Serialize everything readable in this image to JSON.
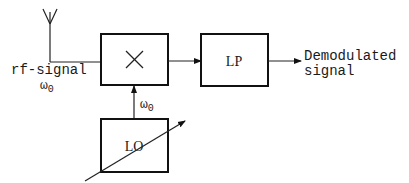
{
  "diagram": {
    "nodes": {
      "antenna": {
        "label": ""
      },
      "input": {
        "label": "rf-signal",
        "frequency": "ω",
        "frequency_sub": "0"
      },
      "mixer": {
        "label": "",
        "symbol": "×"
      },
      "lowpass": {
        "label": "LP"
      },
      "oscillator": {
        "label": "LO",
        "frequency": "ω",
        "frequency_sub": "0",
        "tunable": true
      },
      "output": {
        "line1": "Demodulated",
        "line2": "signal"
      }
    },
    "edges": [
      {
        "from": "antenna",
        "to": "mixer"
      },
      {
        "from": "oscillator",
        "to": "mixer",
        "label": "ω0"
      },
      {
        "from": "mixer",
        "to": "lowpass"
      },
      {
        "from": "lowpass",
        "to": "output"
      }
    ],
    "colors": {
      "stroke": "#111111",
      "background": "#ffffff"
    }
  }
}
